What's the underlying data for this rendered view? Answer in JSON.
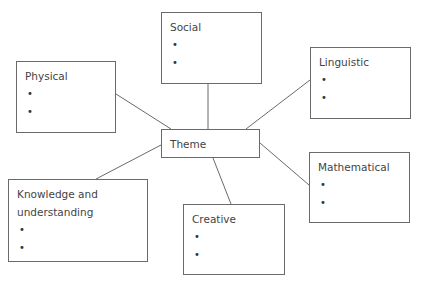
{
  "diagram": {
    "center": {
      "label": "Theme"
    },
    "nodes": [
      {
        "id": "social",
        "label": "Social",
        "bullets": [
          "•",
          "•"
        ]
      },
      {
        "id": "physical",
        "label": "Physical",
        "bullets": [
          "•",
          "•"
        ]
      },
      {
        "id": "linguistic",
        "label": "Linguistic",
        "bullets": [
          "•",
          "•"
        ]
      },
      {
        "id": "mathematical",
        "label": "Mathematical",
        "bullets": [
          "•",
          "•"
        ]
      },
      {
        "id": "knowledge",
        "label_line1": "Knowledge and",
        "label_line2": "understanding",
        "bullets": [
          "•",
          "•"
        ]
      },
      {
        "id": "creative",
        "label": "Creative",
        "bullets": [
          "•",
          "•"
        ]
      }
    ],
    "line_color": "#6a6a6a",
    "border_color": "#6a6a6a"
  }
}
